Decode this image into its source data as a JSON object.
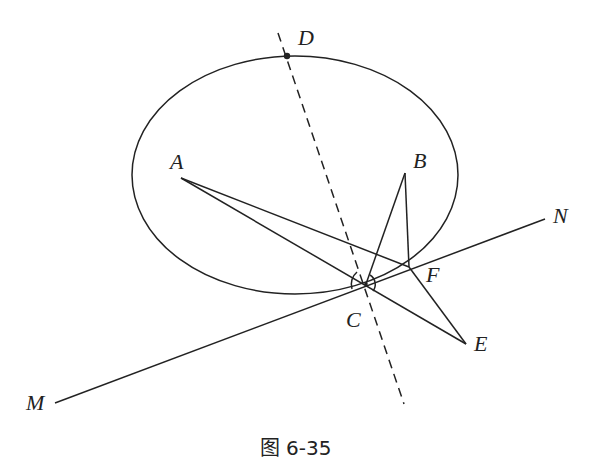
{
  "figure": {
    "caption": "图 6-35",
    "stroke_color": "#222222",
    "labels": {
      "A": "A",
      "B": "B",
      "C": "C",
      "D": "D",
      "E": "E",
      "F": "F",
      "M": "M",
      "N": "N"
    }
  }
}
